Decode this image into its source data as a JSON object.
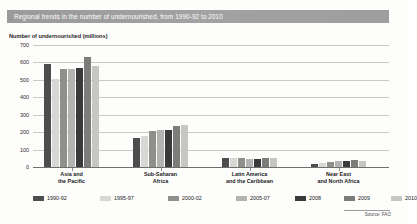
{
  "title": "Regional trends in the number of undernourished, from 1990-92 to 2010",
  "source": "Source: FAO",
  "colors": {
    "title_bar": "#9b9b9b",
    "series": [
      "#4d4d4d",
      "#d7d7d5",
      "#8f8f8d",
      "#b3b3b1",
      "#3a3a3a",
      "#7c7c7a",
      "#c6c6c4"
    ]
  },
  "chart_data": {
    "type": "bar",
    "title": "Regional trends in the number of undernourished, from 1990-92 to 2010",
    "xlabel": "",
    "ylabel": "Number of undernourished (millions)",
    "ylim": [
      0,
      700
    ],
    "yticks": [
      0,
      100,
      200,
      300,
      400,
      500,
      600,
      700
    ],
    "grid": true,
    "legend_position": "bottom",
    "categories": [
      "Asia and the Pacific",
      "Sub-Saharan Africa",
      "Latin America and the Caribbean",
      "Near East and North Africa"
    ],
    "category_lines": [
      [
        "Asia and",
        "the Pacific"
      ],
      [
        "Sub-Saharan",
        "Africa"
      ],
      [
        "Latin America",
        "and the Caribbean"
      ],
      [
        "Near East",
        "and North Africa"
      ]
    ],
    "series": [
      {
        "name": "1990-92",
        "color": "#4d4d4d",
        "values": [
          590,
          165,
          54,
          19
        ]
      },
      {
        "name": "1995-97",
        "color": "#d7d7d5",
        "values": [
          505,
          180,
          53,
          24
        ]
      },
      {
        "name": "2000-02",
        "color": "#8f8f8d",
        "values": [
          560,
          204,
          50,
          29
        ]
      },
      {
        "name": "2005-07",
        "color": "#b3b3b1",
        "values": [
          565,
          210,
          47,
          33
        ]
      },
      {
        "name": "2008",
        "color": "#3a3a3a",
        "values": [
          567,
          212,
          47,
          35
        ]
      },
      {
        "name": "2009",
        "color": "#7c7c7a",
        "values": [
          631,
          237,
          53,
          42
        ]
      },
      {
        "name": "2010",
        "color": "#c6c6c4",
        "values": [
          578,
          239,
          53,
          37
        ]
      }
    ]
  },
  "yticklabels": [
    "700",
    "600",
    "500",
    "400",
    "300",
    "200",
    "100",
    "0"
  ],
  "legend": [
    {
      "label": "1990-92",
      "color": "#4d4d4d"
    },
    {
      "label": "1995-97",
      "color": "#d7d7d5"
    },
    {
      "label": "2000-02",
      "color": "#8f8f8d"
    },
    {
      "label": "2005-07",
      "color": "#b3b3b1"
    },
    {
      "label": "2008",
      "color": "#3a3a3a"
    },
    {
      "label": "2009",
      "color": "#7c7c7a"
    },
    {
      "label": "2010",
      "color": "#c6c6c4"
    }
  ]
}
